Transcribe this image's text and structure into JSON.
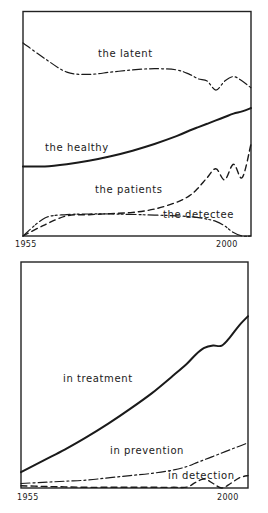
{
  "chart_data": [
    {
      "type": "line",
      "title": "",
      "xlabel": "",
      "ylabel": "",
      "x_ticks": [
        "1955",
        "2000"
      ],
      "xlim": [
        1955,
        2007
      ],
      "ylim": [
        0,
        100
      ],
      "grid": false,
      "legend": "inline labels",
      "x": [
        1955,
        1960,
        1965,
        1970,
        1975,
        1980,
        1985,
        1990,
        1993,
        1995,
        1997,
        1999,
        2001,
        2003,
        2005,
        2007
      ],
      "series": [
        {
          "name": "the latent",
          "style": "dash-dot",
          "values": [
            86,
            79,
            73,
            72,
            73,
            74,
            74.5,
            74,
            72,
            70,
            69,
            65,
            69,
            71,
            69,
            66
          ]
        },
        {
          "name": "the healthy",
          "style": "solid-bold",
          "values": [
            31,
            31,
            32,
            33.5,
            35.5,
            38,
            41,
            44.5,
            47,
            48.5,
            50,
            51.5,
            53,
            54.5,
            55.5,
            57
          ]
        },
        {
          "name": "the patients",
          "style": "dashed",
          "values": [
            0,
            5,
            9,
            9.5,
            10,
            10.5,
            12,
            15,
            18,
            21.5,
            26,
            30,
            25,
            32,
            26,
            41
          ]
        },
        {
          "name": "the detectee",
          "style": "dash-double-dot",
          "values": [
            0,
            8,
            9.5,
            9.8,
            9.8,
            9.6,
            9.3,
            9,
            8.6,
            8.2,
            7.5,
            6.5,
            4.5,
            1.5,
            0,
            0
          ]
        }
      ]
    },
    {
      "type": "line",
      "title": "",
      "xlabel": "",
      "ylabel": "",
      "x_ticks": [
        "1955",
        "2000"
      ],
      "xlim": [
        1955,
        2007
      ],
      "ylim": [
        0,
        100
      ],
      "grid": false,
      "legend": "inline labels",
      "x": [
        1955,
        1960,
        1965,
        1970,
        1975,
        1980,
        1985,
        1990,
        1993,
        1995,
        1997,
        1999,
        2001,
        2003,
        2005,
        2007
      ],
      "series": [
        {
          "name": "in treatment",
          "style": "solid-bold",
          "values": [
            7,
            12,
            17,
            22.5,
            28.5,
            35,
            42,
            50,
            55,
            59,
            62,
            63,
            63,
            67,
            72,
            76
          ]
        },
        {
          "name": "in prevention",
          "style": "dash-dot",
          "values": [
            2,
            2.5,
            3,
            3.5,
            4.5,
            5.5,
            6.5,
            8,
            9.5,
            11,
            12.5,
            14,
            15.5,
            17,
            18.5,
            20
          ]
        },
        {
          "name": "in detection",
          "style": "dashed",
          "values": [
            1,
            0.7,
            0.5,
            0.3,
            0.3,
            0.3,
            0.3,
            0.3,
            0.4,
            2.5,
            4,
            2,
            0,
            2,
            4.5,
            5.5
          ]
        }
      ]
    }
  ],
  "panels": [
    {
      "labels": [
        "the latent",
        "the healthy",
        "the patients",
        "the detectee"
      ],
      "x_ticks": [
        "1955",
        "2000"
      ]
    },
    {
      "labels": [
        "in treatment",
        "in prevention",
        "in detection"
      ],
      "x_ticks": [
        "1955",
        "2000"
      ]
    }
  ]
}
